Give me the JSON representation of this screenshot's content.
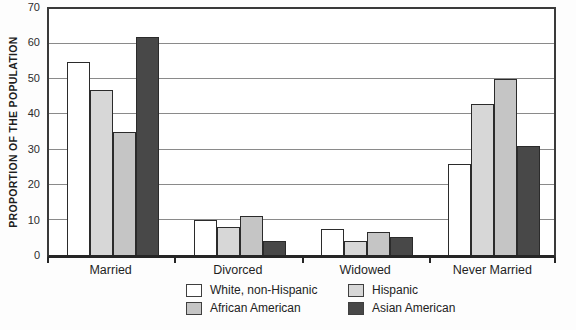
{
  "figure": {
    "background": "#ffffff",
    "frame_color": "#3a3a3a",
    "gridline_color": "#8a8a8a"
  },
  "chart_data": {
    "type": "bar",
    "title": "",
    "xlabel": "",
    "ylabel": "PROPORTION OF THE POPULATION",
    "ylim": [
      0,
      70
    ],
    "yticks": [
      0,
      10,
      20,
      30,
      40,
      50,
      60,
      70
    ],
    "grid": true,
    "legend_position": "bottom",
    "categories": [
      "Married",
      "Divorced",
      "Widowed",
      "Never Married"
    ],
    "series": [
      {
        "name": "White, non-Hispanic",
        "color": "#ffffff",
        "values": [
          55,
          10,
          7.5,
          26
        ]
      },
      {
        "name": "Hispanic",
        "color": "#d7d7d7",
        "values": [
          47,
          8,
          4,
          43
        ]
      },
      {
        "name": "African American",
        "color": "#c5c5c5",
        "values": [
          35,
          11,
          6.5,
          50
        ]
      },
      {
        "name": "Asian American",
        "color": "#484848",
        "values": [
          62,
          4,
          5,
          31
        ]
      }
    ]
  }
}
